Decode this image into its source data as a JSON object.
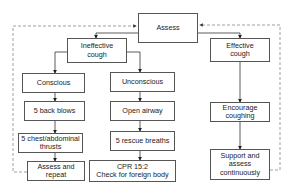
{
  "diagram": {
    "nodes": {
      "assess": "Assess",
      "ineffective": "Ineffective\ncough",
      "effective": "Effective\ncough",
      "conscious": "Conscious",
      "unconscious": "Unconscious",
      "back_blows": "5 back blows",
      "open_airway": "Open airway",
      "chest_thrusts": "5 chest/abdominal\nthrusts",
      "rescue_breaths": "5 rescue breaths",
      "assess_repeat": "Assess and repeat",
      "cpr": "CPR 15:2\nCheck for foreign body",
      "encourage": "Encourage\ncoughing",
      "support": "Support and\nassess\ncontinuously"
    },
    "colors": {
      "line": "#333333",
      "dashed": "#777777",
      "border": "#555555"
    }
  }
}
